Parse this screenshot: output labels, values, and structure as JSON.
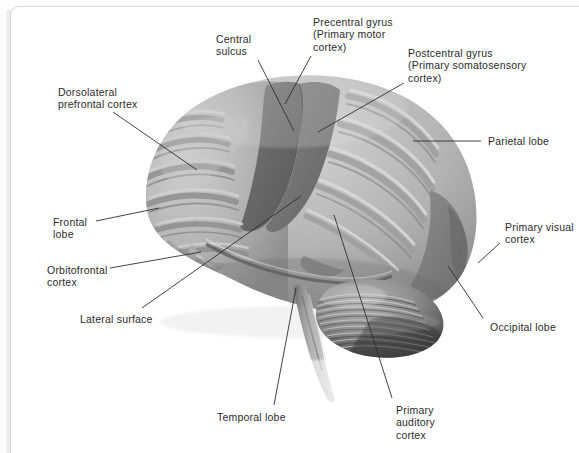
{
  "figure": {
    "view": "left lateral surface",
    "background_color": "#ffffff",
    "border_color": "#d8d8d8"
  },
  "palette": {
    "cortex_light": "#b7b7b7",
    "cortex_mid": "#9c9c9c",
    "cortex_highlight": "#d9d9d9",
    "central_band_dark": "#6d6d6d",
    "occipital_dark": "#7e7e7e",
    "cerebellum": "#8a8a8a",
    "cerebellum_dark": "#4a4a4a",
    "brainstem": "#a0a0a0",
    "leader_line": "#2f2f2f",
    "text": "#2b2b2b"
  },
  "labels": [
    {
      "id": "central-sulcus",
      "lines": [
        "Central",
        "sulcus"
      ],
      "x": 216,
      "y": 33,
      "leader": [
        [
          258,
          60
        ],
        [
          294,
          131
        ]
      ]
    },
    {
      "id": "precentral-gyrus",
      "lines": [
        "Precentral gyrus",
        "(Primary motor",
        "cortex)"
      ],
      "x": 313,
      "y": 16,
      "leader": [
        [
          311,
          56
        ],
        [
          285,
          104
        ]
      ]
    },
    {
      "id": "postcentral-gyrus",
      "lines": [
        "Postcentral gyrus",
        "(Primary somatosensory",
        "cortex)"
      ],
      "x": 408,
      "y": 47,
      "leader": [
        [
          404,
          83
        ],
        [
          318,
          132
        ]
      ]
    },
    {
      "id": "parietal-lobe",
      "lines": [
        "Parietal lobe"
      ],
      "x": 488,
      "y": 135,
      "leader": [
        [
          481,
          141
        ],
        [
          413,
          141
        ]
      ]
    },
    {
      "id": "primary-visual-cortex",
      "lines": [
        "Primary visual",
        "cortex"
      ],
      "x": 505,
      "y": 221,
      "leader": [
        [
          500,
          243
        ],
        [
          478,
          263
        ]
      ]
    },
    {
      "id": "occipital-lobe",
      "lines": [
        "Occipital lobe"
      ],
      "x": 490,
      "y": 321,
      "leader": [
        [
          483,
          318
        ],
        [
          448,
          266
        ]
      ]
    },
    {
      "id": "dorsolateral-prefrontal-cortex",
      "lines": [
        "Dorsolateral",
        "prefrontal cortex"
      ],
      "x": 58,
      "y": 86,
      "leader": [
        [
          113,
          112
        ],
        [
          197,
          170
        ]
      ]
    },
    {
      "id": "frontal-lobe",
      "lines": [
        "Frontal",
        "lobe"
      ],
      "x": 53,
      "y": 216,
      "leader": [
        [
          96,
          221
        ],
        [
          159,
          208
        ]
      ]
    },
    {
      "id": "orbitofrontal-cortex",
      "lines": [
        "Orbitofrontal",
        "cortex"
      ],
      "x": 47,
      "y": 264,
      "leader": [
        [
          110,
          268
        ],
        [
          201,
          252
        ]
      ]
    },
    {
      "id": "lateral-surface",
      "lines": [
        "Lateral surface"
      ],
      "x": 80,
      "y": 313,
      "leader": [
        [
          142,
          308
        ],
        [
          301,
          196
        ]
      ]
    },
    {
      "id": "temporal-lobe",
      "lines": [
        "Temporal lobe"
      ],
      "x": 217,
      "y": 411,
      "leader": [
        [
          274,
          405
        ],
        [
          296,
          288
        ]
      ]
    },
    {
      "id": "primary-auditory-cortex",
      "lines": [
        "Primary",
        "auditory",
        "cortex"
      ],
      "x": 396,
      "y": 404,
      "leader": [
        [
          392,
          398
        ],
        [
          334,
          215
        ]
      ]
    }
  ]
}
